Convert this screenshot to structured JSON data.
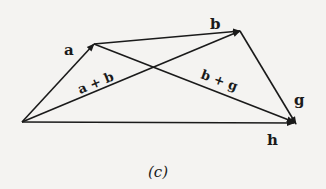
{
  "diagram": {
    "caption": "(c)",
    "points": {
      "O": [
        22,
        122
      ],
      "A": [
        94,
        44
      ],
      "B": [
        240,
        31
      ],
      "G": [
        296,
        124
      ]
    },
    "vectors": [
      {
        "name": "a",
        "from": "O",
        "to": "A",
        "label": "a"
      },
      {
        "name": "b",
        "from": "A",
        "to": "B",
        "label": "b"
      },
      {
        "name": "g",
        "from": "B",
        "to": "G",
        "label": "g"
      },
      {
        "name": "a+b",
        "from": "O",
        "to": "B",
        "label": "a + b"
      },
      {
        "name": "b+g",
        "from": "A",
        "to": "G",
        "label": "b + g"
      },
      {
        "name": "h",
        "from": "O",
        "to": "G",
        "label": "h"
      }
    ],
    "labels": {
      "a": "a",
      "b": "b",
      "g": "g",
      "h": "h",
      "a_plus_b": "a + b",
      "b_plus_g": "b + g"
    },
    "colors": {
      "ink": "#1a1a1a",
      "paper": "#f4f3f1"
    }
  }
}
